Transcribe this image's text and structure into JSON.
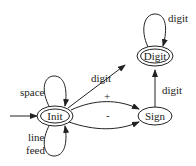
{
  "diagram": {
    "type": "state-machine",
    "states": [
      {
        "id": "init",
        "label": "Init",
        "accepting": true,
        "start": true
      },
      {
        "id": "digit",
        "label": "Digit",
        "accepting": true
      },
      {
        "id": "sign",
        "label": "Sign",
        "accepting": false
      }
    ],
    "transitions": [
      {
        "from": "init",
        "to": "init",
        "label": "space"
      },
      {
        "from": "init",
        "to": "init",
        "label_line1": "line",
        "label_line2": "feed"
      },
      {
        "from": "init",
        "to": "digit",
        "label": "digit"
      },
      {
        "from": "init",
        "to": "sign",
        "label": "+"
      },
      {
        "from": "init",
        "to": "sign",
        "label": "-"
      },
      {
        "from": "sign",
        "to": "digit",
        "label": "digit"
      },
      {
        "from": "digit",
        "to": "digit",
        "label": "digit"
      }
    ]
  }
}
